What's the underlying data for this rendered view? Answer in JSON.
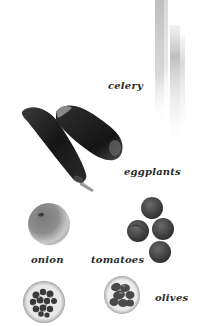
{
  "illustration": {
    "items": [
      {
        "id": "celery",
        "label": "celery"
      },
      {
        "id": "eggplants",
        "label": "eggplants"
      },
      {
        "id": "onion",
        "label": "onion"
      },
      {
        "id": "tomatoes",
        "label": "tomatoes"
      },
      {
        "id": "capers",
        "label": ""
      },
      {
        "id": "olives",
        "label": "olives"
      }
    ]
  },
  "colors": {
    "background": "#ffffff",
    "label_text": "#2a2a2a",
    "eggplant": "#1c1c1c",
    "tomato": "#4a4a4a",
    "onion": "#8a8a8a"
  }
}
